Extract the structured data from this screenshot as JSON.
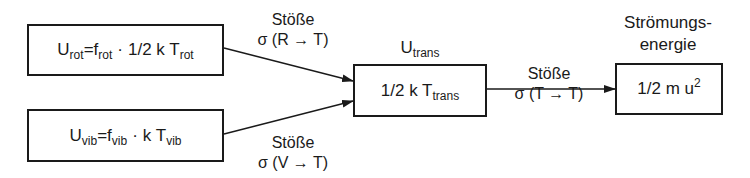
{
  "diagram": {
    "type": "energy-transfer-flow",
    "nodes": {
      "rot": {
        "U": "U",
        "U_sub": "rot",
        "eq": "=",
        "f": "f",
        "f_sub": "rot",
        "dot": "·",
        "factor": "1/2 k T",
        "T_sub": "rot"
      },
      "vib": {
        "U": "U",
        "U_sub": "vib",
        "eq": "=",
        "f": "f",
        "f_sub": "vib",
        "dot": "·",
        "factor": "k T",
        "T_sub": "vib"
      },
      "trans": {
        "title_U": "U",
        "title_sub": "trans",
        "content": "1/2 k T",
        "content_sub": "trans"
      },
      "flow": {
        "title_line1": "Strömungs-",
        "title_line2": "energie",
        "content": "1/2 m u",
        "content_sup": "2"
      }
    },
    "edges": {
      "rot_to_trans": {
        "line1": "Stöße",
        "line2": "σ (R → T)"
      },
      "vib_to_trans": {
        "line1": "Stöße",
        "line2": "σ (V → T)"
      },
      "trans_to_flow": {
        "line1": "Stöße",
        "line2": "σ (T → T)"
      }
    },
    "colors": {
      "stroke": "#1a1a1a",
      "background": "#ffffff"
    }
  }
}
